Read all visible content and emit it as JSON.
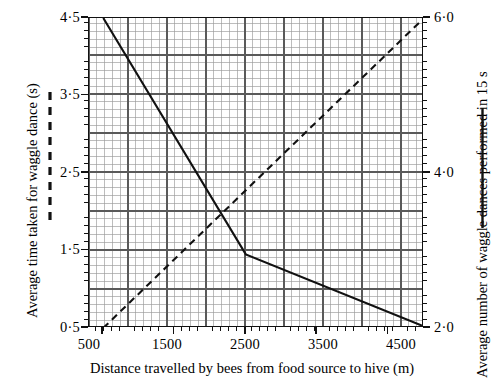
{
  "chart_data": {
    "type": "line",
    "title": "",
    "subtitle": "",
    "xlabel": "Distance travelled by bees from food source to hive (m)",
    "xlim": [
      300,
      5000
    ],
    "xticks": [
      500,
      1500,
      2500,
      3500,
      4500
    ],
    "xticklabels": [
      "500",
      "1500",
      "2500",
      "3500",
      "4500"
    ],
    "grid": true,
    "grid_minor": true,
    "legend": "none",
    "axes": [
      {
        "id": "left",
        "position": "left",
        "ylabel": "Average time taken for waggle dance (s)",
        "ylim": [
          0.5,
          4.5
        ],
        "yticks": [
          0.5,
          1.5,
          2.5,
          3.5,
          4.5
        ],
        "yticklabels": [
          "0·0",
          "1·5",
          "2·5",
          "3·5",
          "4·5"
        ],
        "yticklabels_display": [
          "0·5",
          "1·5",
          "2·5",
          "3·5",
          "4·5"
        ],
        "key_style": "solid"
      },
      {
        "id": "right",
        "position": "right",
        "ylabel": "Average number of waggle dances performed in 15 s",
        "ylim": [
          2.0,
          6.0
        ],
        "yticks": [
          2.0,
          4.0,
          6.0
        ],
        "yticklabels": [
          "2·0",
          "4·0",
          "6·0"
        ],
        "key_style": "dashed"
      }
    ],
    "series": [
      {
        "name": "Average time taken for waggle dance",
        "axis": "left",
        "style": "solid",
        "color": "#111111",
        "points": [
          {
            "x": 500,
            "y": 4.5
          },
          {
            "x": 2500,
            "y": 1.45
          },
          {
            "x": 5000,
            "y": 0.52
          }
        ]
      },
      {
        "name": "Average number of waggle dances performed in 15 s",
        "axis": "right",
        "style": "dashed",
        "color": "#111111",
        "points": [
          {
            "x": 500,
            "y": 2.0
          },
          {
            "x": 5000,
            "y": 6.0
          }
        ]
      }
    ]
  },
  "labels": {
    "x_axis_title": "Distance travelled by bees from food source to hive (m)",
    "y_left_axis_title": "Average time taken for waggle dance (s)",
    "y_right_axis_title": "Average number of waggle dances performed in 15 s",
    "y_left_ticks": [
      "4·5",
      "3·5",
      "2·5",
      "1·5",
      "0·5"
    ],
    "y_right_ticks": [
      "6·0",
      "4·0",
      "2·0"
    ],
    "x_ticks": [
      "500",
      "1500",
      "2500",
      "3500",
      "4500"
    ]
  },
  "keys": {
    "left_key_name": "dashed-line-key",
    "right_key_name": "solid-line-key"
  },
  "style": {
    "axis_color": "#111111",
    "grid_major_color": "#5a5a5a",
    "grid_minor_color": "#9a9a9a",
    "series_color": "#111111",
    "background": "#ffffff"
  }
}
